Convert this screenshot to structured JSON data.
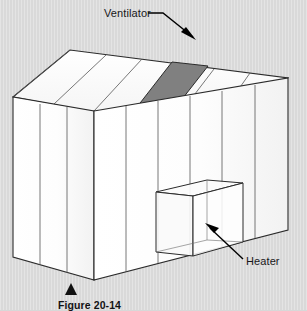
{
  "figure": {
    "caption": "Figure 20-14",
    "caption_marker": "black-triangle",
    "background_color": "#d9d9d9"
  },
  "labels": {
    "ventilator": "Ventilator",
    "heater": "Heater"
  },
  "colors": {
    "panel_fill": "#fefefe",
    "panel_fill_shaded": "#f4f4f4",
    "ventilator_fill": "#808080",
    "outline": "#2b2b2b",
    "panel_line": "#555555",
    "arrow": "#000000",
    "text": "#17171a"
  },
  "parts": [
    {
      "name": "roof-left-slope",
      "description": "paneled left roof plane"
    },
    {
      "name": "roof-right-slope",
      "description": "paneled right roof plane"
    },
    {
      "name": "gable-end-wall",
      "description": "left end wall with three vertical panels"
    },
    {
      "name": "front-wall",
      "description": "long front wall with vertical glazing panels"
    },
    {
      "name": "ventilator-panel",
      "description": "shaded roof vent panel"
    },
    {
      "name": "heater-unit",
      "description": "box-shaped heater inside along the front wall"
    }
  ]
}
